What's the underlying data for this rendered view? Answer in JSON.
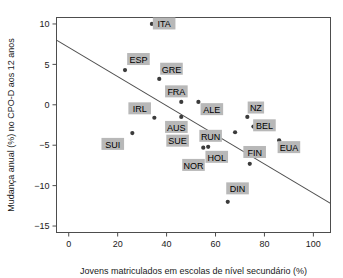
{
  "chart_data": {
    "type": "scatter",
    "title": "",
    "xlabel": "Jovens matriculados em escolas de nível secundário (%)",
    "ylabel": "Mudança anual (%)  no CPO-D aos 12 anos",
    "xlim": [
      -5,
      107
    ],
    "ylim": [
      -15.8,
      10.8
    ],
    "xticks": [
      0,
      20,
      40,
      60,
      80,
      100
    ],
    "xticklabels": [
      "0",
      "20",
      "40",
      "60",
      "80",
      "100"
    ],
    "yticks": [
      10,
      5,
      0,
      -5,
      -10,
      -15
    ],
    "yticklabels": [
      "10",
      "5",
      "0",
      "−5",
      "−10",
      "−15"
    ],
    "grid": false,
    "legend": null,
    "point_color": "#3b3b3b",
    "label_bg_color": "#b8b8b8",
    "line_color": "#4d4d4d",
    "trendline": {
      "type": "linear",
      "x_start": -5,
      "y_start": 8.0,
      "x_end": 107,
      "y_end": -12.2
    },
    "points": [
      {
        "label": "ITA",
        "x": 34,
        "y": 10.0,
        "lx": 39,
        "ly": 10.0
      },
      {
        "label": "ESP",
        "x": 23,
        "y": 4.3,
        "lx": 28.5,
        "ly": 5.6
      },
      {
        "label": "GRE",
        "x": 37,
        "y": 3.2,
        "lx": 42,
        "ly": 4.4
      },
      {
        "label": "FRA",
        "x": 46,
        "y": 0.35,
        "lx": 44,
        "ly": 1.6
      },
      {
        "label": "IRL",
        "x": 35,
        "y": -1.6,
        "lx": 29,
        "ly": -0.5
      },
      {
        "label": "ALE",
        "x": 53,
        "y": 0.35,
        "lx": 58.5,
        "ly": -0.6
      },
      {
        "label": "NZ",
        "x": 73,
        "y": -1.5,
        "lx": 76.5,
        "ly": -0.4
      },
      {
        "label": "BEL",
        "x": 75.5,
        "y": -2.7,
        "lx": 80,
        "ly": -2.6
      },
      {
        "label": "AUS",
        "x": 46,
        "y": -1.5,
        "lx": 44,
        "ly": -2.8
      },
      {
        "label": "SUI",
        "x": 26,
        "y": -3.5,
        "lx": 18,
        "ly": -4.9
      },
      {
        "label": "SUE",
        "x": 48,
        "y": -4.8,
        "lx": 44.5,
        "ly": -4.5
      },
      {
        "label": "RUN",
        "x": 57,
        "y": -5.2,
        "lx": 58,
        "ly": -3.9
      },
      {
        "label": "EUA",
        "x": 86,
        "y": -4.4,
        "lx": 90,
        "ly": -5.3
      },
      {
        "label": "HOL",
        "x": 57,
        "y": -6.2,
        "lx": 60.5,
        "ly": -6.5
      },
      {
        "label": "NOR",
        "x": 55,
        "y": -5.3,
        "lx": 51,
        "ly": -7.5
      },
      {
        "label": "FIN",
        "x": 74,
        "y": -7.3,
        "lx": 76,
        "ly": -5.9
      },
      {
        "label": "RUN2",
        "x": 68,
        "y": -3.4,
        "lx": null,
        "ly": null
      },
      {
        "label": "DIN",
        "x": 65,
        "y": -12.0,
        "lx": 69,
        "ly": -10.4
      }
    ]
  }
}
